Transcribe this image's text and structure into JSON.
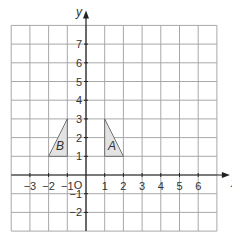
{
  "chart_data": {
    "type": "coordinate-grid",
    "title": "",
    "xlabel": "x",
    "ylabel": "y",
    "xlim": [
      -4,
      7
    ],
    "ylim": [
      -3,
      8
    ],
    "grid": true,
    "origin_label": "O",
    "x_ticks": [
      -3,
      -2,
      -1,
      1,
      2,
      3,
      4,
      5,
      6
    ],
    "y_ticks": [
      -2,
      -1,
      1,
      2,
      3,
      4,
      5,
      6,
      7
    ],
    "shapes": [
      {
        "label": "A",
        "vertices": [
          [
            1,
            1
          ],
          [
            1,
            3
          ],
          [
            2,
            1
          ]
        ],
        "fill": "#e3e3e3"
      },
      {
        "label": "B",
        "vertices": [
          [
            -1,
            1
          ],
          [
            -1,
            3
          ],
          [
            -2,
            1
          ]
        ],
        "fill": "#e3e3e3"
      }
    ]
  },
  "colors": {
    "grid": "#a8a8a8",
    "axis": "#222222",
    "shape_fill": "#e3e3e3",
    "shape_stroke": "#555555",
    "text": "#333333"
  },
  "geometry": {
    "origin_px": [
      86,
      175
    ],
    "cell_px": 18.7
  }
}
